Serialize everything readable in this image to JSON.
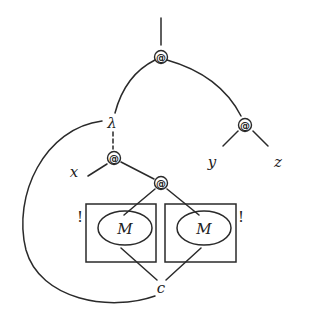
{
  "diagram": {
    "type": "proof-net / lambda term graph",
    "nodes": {
      "root_app": {
        "label": "@",
        "x": 161,
        "y": 57
      },
      "lambda": {
        "label": "λ",
        "x": 112,
        "y": 123
      },
      "right_app": {
        "label": "@",
        "x": 245,
        "y": 125
      },
      "inner_app": {
        "label": "@",
        "x": 114,
        "y": 158
      },
      "lower_app": {
        "label": "@",
        "x": 161,
        "y": 183
      },
      "var_x": {
        "label": "x",
        "x": 74,
        "y": 172
      },
      "var_y": {
        "label": "y",
        "x": 212,
        "y": 164
      },
      "var_z": {
        "label": "z",
        "x": 278,
        "y": 164
      },
      "contraction": {
        "label": "c",
        "x": 161,
        "y": 292
      },
      "left_box": {
        "label": "M",
        "bang": "!"
      },
      "right_box": {
        "label": "M",
        "bang": "!"
      }
    },
    "edges": [
      {
        "from": "top",
        "to": "root_app"
      },
      {
        "from": "root_app",
        "to": "lambda"
      },
      {
        "from": "root_app",
        "to": "right_app"
      },
      {
        "from": "right_app",
        "to": "var_y"
      },
      {
        "from": "right_app",
        "to": "var_z"
      },
      {
        "from": "lambda",
        "to": "inner_app",
        "style": "dashed"
      },
      {
        "from": "inner_app",
        "to": "var_x"
      },
      {
        "from": "inner_app",
        "to": "lower_app"
      },
      {
        "from": "lower_app",
        "to": "left_box"
      },
      {
        "from": "lower_app",
        "to": "right_box"
      },
      {
        "from": "left_box",
        "to": "contraction"
      },
      {
        "from": "right_box",
        "to": "contraction"
      },
      {
        "from": "contraction",
        "to": "lambda",
        "style": "arc"
      }
    ],
    "colors": {
      "stroke": "#2a2a2a",
      "background": "#ffffff"
    }
  }
}
